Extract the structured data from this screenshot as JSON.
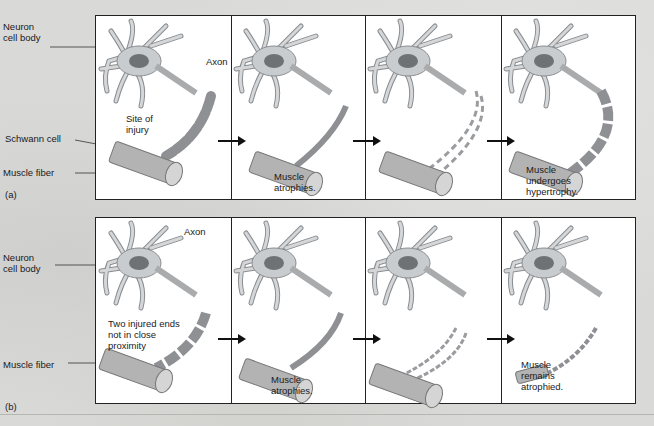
{
  "figure": {
    "row_a": {
      "tag": "(a)",
      "outer_labels": {
        "neuron_cell_body": "Neuron\ncell body",
        "schwann_cell": "Schwann cell",
        "muscle_fiber": "Muscle fiber"
      },
      "panels": [
        {
          "labels": {
            "axon": "Axon",
            "site_of_injury": "Site of\ninjury"
          }
        },
        {
          "caption": "Muscle\natrophies."
        },
        {
          "caption": ""
        },
        {
          "caption": "Muscle\nundergoes\nhypertrophy."
        }
      ]
    },
    "row_b": {
      "tag": "(b)",
      "outer_labels": {
        "neuron_cell_body": "Neuron\ncell body",
        "muscle_fiber": "Muscle fiber"
      },
      "panels": [
        {
          "labels": {
            "axon": "Axon",
            "two_injured_ends": "Two injured ends\nnot in close\nproximity"
          }
        },
        {
          "caption": "Muscle\natrophies."
        },
        {
          "caption": ""
        },
        {
          "caption": "Muscle\nremains\natrophied."
        }
      ]
    }
  },
  "colors": {
    "background": "#d9d9d7",
    "panel": "#ffffff",
    "neuron_fill": "#c9cccf",
    "neuron_stroke": "#8a8d90",
    "nucleus": "#6f7275",
    "schwann_fill": "#a9abad",
    "muscle_fill": "#b3b3b3",
    "border": "#222222"
  }
}
